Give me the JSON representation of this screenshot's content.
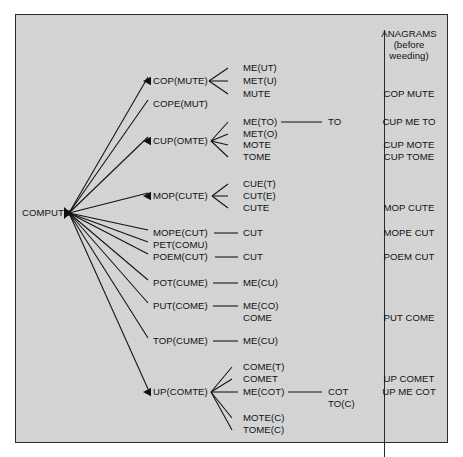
{
  "diagram": {
    "title_hidden": "",
    "root": {
      "label": "COMPUTE",
      "x": 22,
      "y": 213
    },
    "hub": {
      "x": 69,
      "y": 213
    },
    "level1": [
      {
        "id": "cop",
        "label": "COP(MUTE)",
        "x": 153,
        "y": 81,
        "tip_x": 151,
        "anchor_x": 209
      },
      {
        "id": "cope",
        "label": "COPE(MUT)",
        "x": 153,
        "y": 104,
        "tip_x": 151,
        "anchor_x": 211
      },
      {
        "id": "cup",
        "label": "CUP(OMTE)",
        "x": 153,
        "y": 141,
        "tip_x": 151,
        "anchor_x": 211
      },
      {
        "id": "mop",
        "label": "MOP(CUTE)",
        "x": 153,
        "y": 196,
        "tip_x": 151,
        "anchor_x": 212
      },
      {
        "id": "mope",
        "label": "MOPE(CUT)",
        "x": 153,
        "y": 233,
        "tip_x": 151,
        "anchor_x": 214
      },
      {
        "id": "pet",
        "label": "PET(COMU)",
        "x": 153,
        "y": 245,
        "tip_x": 151,
        "anchor_x": 214
      },
      {
        "id": "poem",
        "label": "POEM(CUT)",
        "x": 153,
        "y": 257,
        "tip_x": 151,
        "anchor_x": 215
      },
      {
        "id": "pot",
        "label": "POT(CUME)",
        "x": 153,
        "y": 283,
        "tip_x": 151,
        "anchor_x": 213
      },
      {
        "id": "put",
        "label": "PUT(COME)",
        "x": 153,
        "y": 306,
        "tip_x": 151,
        "anchor_x": 213
      },
      {
        "id": "top",
        "label": "TOP(CUME)",
        "x": 153,
        "y": 341,
        "tip_x": 151,
        "anchor_x": 213
      },
      {
        "id": "up",
        "label": "UP(COMTE)",
        "x": 153,
        "y": 392,
        "tip_x": 151,
        "anchor_x": 211
      }
    ],
    "level2": [
      {
        "parent": "cop",
        "label": "ME(UT)",
        "x": 243,
        "y": 68,
        "line_from_x": 226
      },
      {
        "parent": "cop",
        "label": "MET(U)",
        "x": 243,
        "y": 81,
        "line_from_x": 226
      },
      {
        "parent": "cop",
        "label": "MUTE",
        "x": 243,
        "y": 94,
        "line_from_x": 226
      },
      {
        "parent": "cup",
        "label": "ME(TO)",
        "x": 243,
        "y": 122,
        "line_from_x": 226
      },
      {
        "parent": "cup",
        "label": "MET(O)",
        "x": 243,
        "y": 134,
        "line_from_x": 226
      },
      {
        "parent": "cup",
        "label": "MOTE",
        "x": 243,
        "y": 145,
        "line_from_x": 226
      },
      {
        "parent": "cup",
        "label": "TOME",
        "x": 243,
        "y": 157,
        "line_from_x": 226
      },
      {
        "parent": "mop",
        "label": "CUE(T)",
        "x": 243,
        "y": 184,
        "line_from_x": 226
      },
      {
        "parent": "mop",
        "label": "CUT(E)",
        "x": 243,
        "y": 196,
        "line_from_x": 226
      },
      {
        "parent": "mop",
        "label": "CUTE",
        "x": 243,
        "y": 208,
        "line_from_x": 226
      },
      {
        "parent": "mope",
        "label": "CUT",
        "x": 243,
        "y": 233,
        "line_from_x": 226
      },
      {
        "parent": "poem",
        "label": "CUT",
        "x": 243,
        "y": 257,
        "line_from_x": 226
      },
      {
        "parent": "pot",
        "label": "ME(CU)",
        "x": 243,
        "y": 283,
        "line_from_x": 226
      },
      {
        "parent": "put",
        "label": "ME(CO)",
        "x": 243,
        "y": 306,
        "line_from_x": 226
      },
      {
        "parent": "put",
        "label": "COME",
        "x": 243,
        "y": 318,
        "line_from_x": null
      },
      {
        "parent": "top",
        "label": "ME(CU)",
        "x": 243,
        "y": 341,
        "line_from_x": 226
      },
      {
        "parent": "up",
        "label": "COME(T)",
        "x": 243,
        "y": 367,
        "line_from_x": 226
      },
      {
        "parent": "up",
        "label": "COMET",
        "x": 243,
        "y": 379,
        "line_from_x": 226
      },
      {
        "parent": "up",
        "label": "ME(COT)",
        "x": 243,
        "y": 392,
        "line_from_x": 226
      },
      {
        "parent": "up",
        "label": "MOTE(C)",
        "x": 243,
        "y": 418,
        "line_from_x": 226
      },
      {
        "parent": "up",
        "label": "TOME(C)",
        "x": 243,
        "y": 430,
        "line_from_x": 226
      }
    ],
    "level3": [
      {
        "label": "TO",
        "x": 328,
        "y": 122,
        "line_from_x": 279,
        "line_to_x": 324
      },
      {
        "label": "COT",
        "x": 328,
        "y": 392,
        "line_from_x": 285,
        "line_to_x": 324
      },
      {
        "label": "TO(C)",
        "x": 328,
        "y": 404,
        "line_from_x": null,
        "line_to_x": null
      }
    ],
    "edges_fan": [
      {
        "to": "cop",
        "x2": 148,
        "y2": 77
      },
      {
        "to": "cope",
        "x2": 148,
        "y2": 100
      },
      {
        "to": "cup",
        "x2": 148,
        "y2": 137
      },
      {
        "to": "mop",
        "x2": 148,
        "y2": 193
      },
      {
        "to": "mope",
        "x2": 148,
        "y2": 230
      },
      {
        "to": "pet",
        "x2": 148,
        "y2": 242
      },
      {
        "to": "poem",
        "x2": 148,
        "y2": 254
      },
      {
        "to": "pot",
        "x2": 148,
        "y2": 280
      },
      {
        "to": "put",
        "x2": 148,
        "y2": 303
      },
      {
        "to": "top",
        "x2": 148,
        "y2": 338
      },
      {
        "to": "up",
        "x2": 148,
        "y2": 389
      }
    ],
    "edges_sub": [
      {
        "from_x": 209,
        "from_y": 81,
        "to_x": 228,
        "to_y": 68
      },
      {
        "from_x": 209,
        "from_y": 81,
        "to_x": 228,
        "to_y": 81
      },
      {
        "from_x": 209,
        "from_y": 81,
        "to_x": 228,
        "to_y": 94
      },
      {
        "from_x": 211,
        "from_y": 141,
        "to_x": 228,
        "to_y": 122
      },
      {
        "from_x": 211,
        "from_y": 141,
        "to_x": 228,
        "to_y": 134
      },
      {
        "from_x": 211,
        "from_y": 141,
        "to_x": 228,
        "to_y": 145
      },
      {
        "from_x": 211,
        "from_y": 141,
        "to_x": 228,
        "to_y": 157
      },
      {
        "from_x": 212,
        "from_y": 196,
        "to_x": 228,
        "to_y": 184
      },
      {
        "from_x": 212,
        "from_y": 196,
        "to_x": 228,
        "to_y": 196
      },
      {
        "from_x": 212,
        "from_y": 196,
        "to_x": 228,
        "to_y": 208
      },
      {
        "from_x": 214,
        "from_y": 233,
        "to_x": 238,
        "to_y": 233
      },
      {
        "from_x": 215,
        "from_y": 257,
        "to_x": 238,
        "to_y": 257
      },
      {
        "from_x": 213,
        "from_y": 283,
        "to_x": 238,
        "to_y": 283
      },
      {
        "from_x": 213,
        "from_y": 306,
        "to_x": 238,
        "to_y": 306
      },
      {
        "from_x": 213,
        "from_y": 341,
        "to_x": 238,
        "to_y": 341
      },
      {
        "from_x": 211,
        "from_y": 392,
        "to_x": 232,
        "to_y": 367
      },
      {
        "from_x": 211,
        "from_y": 392,
        "to_x": 232,
        "to_y": 379
      },
      {
        "from_x": 211,
        "from_y": 392,
        "to_x": 238,
        "to_y": 392
      },
      {
        "from_x": 211,
        "from_y": 392,
        "to_x": 232,
        "to_y": 418
      },
      {
        "from_x": 211,
        "from_y": 392,
        "to_x": 232,
        "to_y": 430
      }
    ],
    "edges_tail": [
      {
        "from_x": 281,
        "from_y": 122,
        "to_x": 322,
        "to_y": 122
      },
      {
        "from_x": 288,
        "from_y": 392,
        "to_x": 322,
        "to_y": 392
      }
    ],
    "arrowheads": [
      {
        "x": 150,
        "y": 81
      },
      {
        "x": 150,
        "y": 141
      },
      {
        "x": 150,
        "y": 196
      },
      {
        "x": 150,
        "y": 392
      }
    ]
  },
  "anagrams_column": {
    "header_lines": [
      "ANAGRAMS",
      "(before",
      "weeding)"
    ],
    "header_y": [
      34,
      45,
      56
    ],
    "header_x": 409,
    "items": [
      {
        "label": "COP MUTE",
        "x": 409,
        "y": 94
      },
      {
        "label": "CUP ME TO",
        "x": 409,
        "y": 122
      },
      {
        "label": "CUP MOTE",
        "x": 409,
        "y": 145
      },
      {
        "label": "CUP TOME",
        "x": 409,
        "y": 157
      },
      {
        "label": "MOP CUTE",
        "x": 409,
        "y": 208
      },
      {
        "label": "MOPE CUT",
        "x": 409,
        "y": 233
      },
      {
        "label": "POEM CUT",
        "x": 409,
        "y": 257
      },
      {
        "label": "PUT COME",
        "x": 409,
        "y": 318
      },
      {
        "label": "UP COMET",
        "x": 409,
        "y": 379
      },
      {
        "label": "UP ME COT",
        "x": 409,
        "y": 392
      }
    ]
  },
  "colors": {
    "panel_bg": "#d4d4d4",
    "ink": "#111111",
    "border": "#2b2b2b",
    "page_bg": "#ffffff"
  }
}
